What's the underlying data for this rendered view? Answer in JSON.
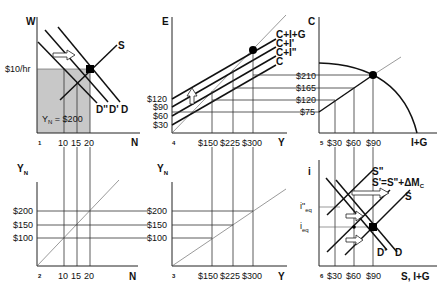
{
  "panels": {
    "p1": {
      "number": "1",
      "y_axis": "W",
      "x_axis": "N",
      "wage_label": "$10/hr",
      "x_ticks": [
        "10",
        "15",
        "20"
      ],
      "curves": [
        "S",
        "D''",
        "D'",
        "D"
      ],
      "area_label_main": "Y",
      "area_label_sub": "N",
      "area_label_value": " = $200",
      "shade_color": "#c8c8c8"
    },
    "p2": {
      "number": "2",
      "y_axis_main": "Y",
      "y_axis_sub": "N",
      "x_axis": "N",
      "y_ticks": [
        "$200",
        "$150",
        "$100"
      ],
      "x_ticks": [
        "10",
        "15",
        "20"
      ]
    },
    "p3": {
      "number": "3",
      "y_axis_main": "Y",
      "y_axis_sub": "N",
      "x_axis": "Y",
      "y_ticks": [
        "$200",
        "$150",
        "$100"
      ],
      "x_ticks": [
        "$150",
        "$225",
        "$300"
      ]
    },
    "p4": {
      "number": "4",
      "y_axis": "E",
      "x_axis": "Y",
      "y_ticks": [
        "$120",
        "$90",
        "$60",
        "$30"
      ],
      "x_ticks": [
        "$150",
        "$225",
        "$300"
      ],
      "curves": [
        "C+I+G",
        "C+I'",
        "C+I\"",
        "C"
      ]
    },
    "p5": {
      "number": "5",
      "y_axis": "C",
      "x_axis": "I+G",
      "y_ticks": [
        "$210",
        "$165",
        "$120",
        "$75"
      ],
      "x_ticks": [
        "$30",
        "$60",
        "$90"
      ]
    },
    "p6": {
      "number": "6",
      "y_axis": "i",
      "x_axis": "S, I+G",
      "y_ticks": [
        "i\"",
        "eq",
        "i",
        "eq"
      ],
      "i2_main": "i\"",
      "i2_sub": "eq",
      "i1_main": "i",
      "i1_sub": "eq",
      "x_ticks": [
        "$30",
        "$60",
        "$90"
      ],
      "curves": [
        "S\"",
        "S'=S\"+ΔM",
        "C",
        "S",
        "D'",
        "D"
      ]
    }
  }
}
